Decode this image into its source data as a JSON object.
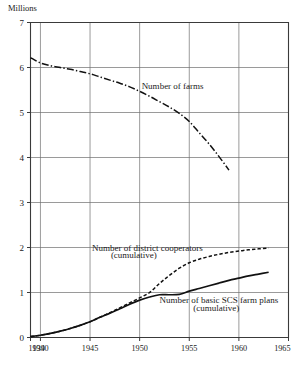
{
  "chart_data": {
    "type": "line",
    "title": "",
    "subtitle": "",
    "xlabel": "",
    "ylabel": "Millions",
    "xlim": [
      1939,
      1965
    ],
    "ylim": [
      0,
      7
    ],
    "grid": true,
    "legend_position": "inline-annotations",
    "x_ticks": [
      "1939",
      "1940",
      "1945",
      "1950",
      "1955",
      "1960",
      "1965"
    ],
    "x_tick_values": [
      1939,
      1940,
      1945,
      1950,
      1955,
      1960,
      1965
    ],
    "y_ticks": [
      "0",
      "1",
      "2",
      "3",
      "4",
      "5",
      "6",
      "7"
    ],
    "y_tick_values": [
      0,
      1,
      2,
      3,
      4,
      5,
      6,
      7
    ],
    "series": [
      {
        "name": "Number of farms",
        "style": "dash-dot",
        "x": [
          1939,
          1940,
          1941,
          1942,
          1943,
          1944,
          1945,
          1946,
          1947,
          1948,
          1949,
          1950,
          1951,
          1952,
          1953,
          1954,
          1955,
          1956,
          1957,
          1958,
          1959
        ],
        "values": [
          6.22,
          6.1,
          6.04,
          6.0,
          5.96,
          5.91,
          5.86,
          5.79,
          5.72,
          5.65,
          5.57,
          5.47,
          5.36,
          5.24,
          5.12,
          4.98,
          4.8,
          4.55,
          4.3,
          4.02,
          3.72
        ]
      },
      {
        "name": "Number of district cooperators (cumulative)",
        "style": "dashed",
        "x": [
          1939,
          1940,
          1941,
          1942,
          1943,
          1944,
          1945,
          1946,
          1947,
          1948,
          1949,
          1950,
          1951,
          1952,
          1953,
          1954,
          1955,
          1956,
          1957,
          1958,
          1959,
          1960,
          1961,
          1962,
          1963
        ],
        "values": [
          0.02,
          0.05,
          0.09,
          0.14,
          0.2,
          0.27,
          0.35,
          0.45,
          0.55,
          0.66,
          0.77,
          0.88,
          1.0,
          1.2,
          1.38,
          1.54,
          1.66,
          1.74,
          1.8,
          1.85,
          1.89,
          1.92,
          1.95,
          1.97,
          1.99
        ]
      },
      {
        "name": "Number of basic SCS farm plans (cumulative)",
        "style": "solid",
        "x": [
          1939,
          1940,
          1941,
          1942,
          1943,
          1944,
          1945,
          1946,
          1947,
          1948,
          1949,
          1950,
          1951,
          1952,
          1953,
          1954,
          1955,
          1956,
          1957,
          1958,
          1959,
          1960,
          1961,
          1962,
          1963
        ],
        "values": [
          0.02,
          0.05,
          0.09,
          0.14,
          0.2,
          0.27,
          0.35,
          0.45,
          0.54,
          0.64,
          0.74,
          0.83,
          0.9,
          0.95,
          0.95,
          0.96,
          1.03,
          1.09,
          1.15,
          1.21,
          1.27,
          1.32,
          1.37,
          1.41,
          1.45
        ]
      }
    ],
    "annotations": [
      {
        "id": "farms",
        "text": "Number of farms",
        "x": 1950.2,
        "y": 5.53
      },
      {
        "id": "coop-line1",
        "text": "Number of district cooperators",
        "x": 1945.2,
        "y": 1.93
      },
      {
        "id": "coop-line2",
        "text": "(cumulative)",
        "x": 1947.1,
        "y": 1.77
      },
      {
        "id": "scs-line1",
        "text": "Number of basic SCS farm plans",
        "x": 1952.0,
        "y": 0.77
      },
      {
        "id": "scs-line2",
        "text": "(cumulative)",
        "x": 1955.4,
        "y": 0.6
      }
    ],
    "colors": {
      "line": "#111111",
      "grid": "#6e6e6e",
      "frame": "#3a3a3a",
      "text": "#1a1a1a",
      "background": "#ffffff"
    }
  }
}
